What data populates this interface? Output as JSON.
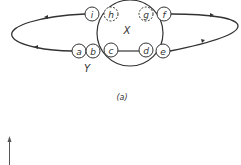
{
  "diagram": {
    "caption": "(a)",
    "big_circle_label": "X",
    "group_label": "Y",
    "nodes": [
      {
        "id": "i",
        "label": "i",
        "style": "solid"
      },
      {
        "id": "h",
        "label": "h",
        "style": "dashed"
      },
      {
        "id": "g",
        "label": "g",
        "style": "dashed"
      },
      {
        "id": "f",
        "label": "f",
        "style": "solid"
      },
      {
        "id": "a",
        "label": "a",
        "style": "solid"
      },
      {
        "id": "b",
        "label": "b",
        "style": "solid"
      },
      {
        "id": "c",
        "label": "c",
        "style": "solid"
      },
      {
        "id": "d",
        "label": "d",
        "style": "solid"
      },
      {
        "id": "e",
        "label": "e",
        "style": "solid"
      }
    ],
    "edges": [
      {
        "from": "i",
        "to": "a",
        "path": "left loop",
        "direction": "i to a"
      },
      {
        "from": "e",
        "to": "f",
        "path": "right loop",
        "direction": "e to f"
      },
      {
        "from": "c",
        "to": "d",
        "path": "chord inside X"
      }
    ],
    "colors": {
      "stroke": "#333333",
      "background": "#ffffff"
    }
  }
}
